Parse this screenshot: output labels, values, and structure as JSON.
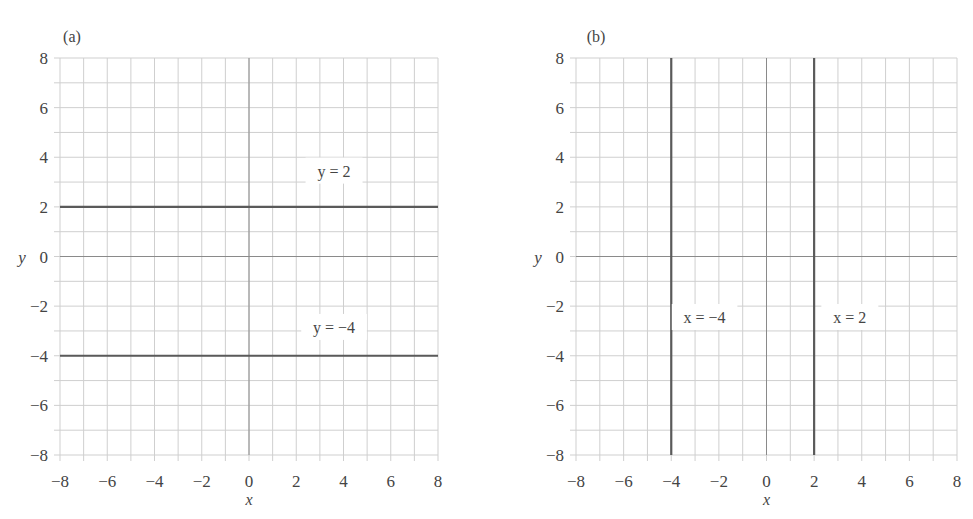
{
  "chart_data": [
    {
      "type": "line",
      "panel_label": "(a)",
      "title": "",
      "xlabel": "x",
      "ylabel": "y",
      "xlim": [
        -8,
        8
      ],
      "ylim": [
        -8,
        8
      ],
      "grid": true,
      "grid_step": 1,
      "xticks": [
        -8,
        -6,
        -4,
        -2,
        0,
        2,
        4,
        6,
        8
      ],
      "yticks": [
        8,
        6,
        4,
        2,
        0,
        -2,
        -4,
        -6,
        -8
      ],
      "xtick_labels": [
        "−8",
        "−6",
        "−4",
        "−2",
        "0",
        "2",
        "4",
        "6",
        "8"
      ],
      "ytick_labels": [
        "8",
        "6",
        "4",
        "2",
        "0",
        "−2",
        "−4",
        "−6",
        "−8"
      ],
      "series": [
        {
          "name": "y = 2",
          "orientation": "horizontal",
          "constant": 2,
          "x": [
            -8,
            8
          ],
          "y": [
            2,
            2
          ]
        },
        {
          "name": "y = −4",
          "orientation": "horizontal",
          "constant": -4,
          "x": [
            -8,
            8
          ],
          "y": [
            -4,
            -4
          ]
        }
      ],
      "annotations": [
        {
          "text": "y = 2",
          "x": 3.6,
          "y": 3.3
        },
        {
          "text": "y = −4",
          "x": 3.6,
          "y": -3.0
        }
      ]
    },
    {
      "type": "line",
      "panel_label": "(b)",
      "title": "",
      "xlabel": "x",
      "ylabel": "y",
      "xlim": [
        -8,
        8
      ],
      "ylim": [
        -8,
        8
      ],
      "grid": true,
      "grid_step": 1,
      "xticks": [
        -8,
        -6,
        -4,
        -2,
        0,
        2,
        4,
        6,
        8
      ],
      "yticks": [
        8,
        6,
        4,
        2,
        0,
        -2,
        -4,
        -6,
        -8
      ],
      "xtick_labels": [
        "−8",
        "−6",
        "−4",
        "−2",
        "0",
        "2",
        "4",
        "6",
        "8"
      ],
      "ytick_labels": [
        "8",
        "6",
        "4",
        "2",
        "0",
        "−2",
        "−4",
        "−6",
        "−8"
      ],
      "series": [
        {
          "name": "x = −4",
          "orientation": "vertical",
          "constant": -4,
          "x": [
            -4,
            -4
          ],
          "y": [
            -8,
            8
          ]
        },
        {
          "name": "x = 2",
          "orientation": "vertical",
          "constant": 2,
          "x": [
            2,
            2
          ],
          "y": [
            -8,
            8
          ]
        }
      ],
      "annotations": [
        {
          "text": "x = −4",
          "x": -2.6,
          "y": -2.6
        },
        {
          "text": "x = 2",
          "x": 3.5,
          "y": -2.6
        }
      ]
    }
  ],
  "colors": {
    "line": "#5a5a5a",
    "grid": "#cfcfcf",
    "axis_zero": "#8a8a8a",
    "text": "#444444",
    "background": "#ffffff"
  },
  "layout": {
    "panels": [
      {
        "x0": 60,
        "x1": 438,
        "y_top": 58,
        "y_bottom": 455
      },
      {
        "x0": 576,
        "x1": 957,
        "y_top": 58,
        "y_bottom": 455
      }
    ]
  }
}
